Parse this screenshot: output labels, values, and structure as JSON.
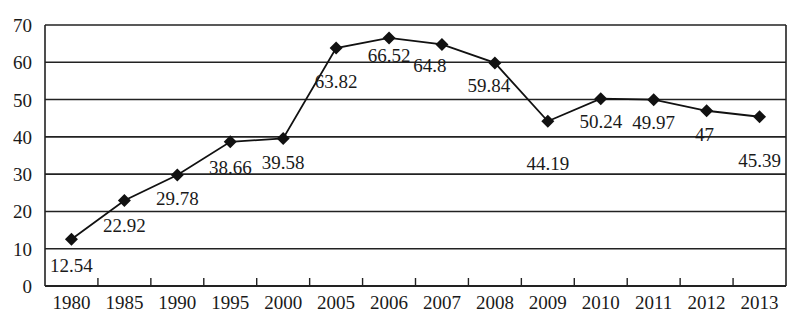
{
  "chart_data": {
    "type": "line",
    "title": "",
    "xlabel": "",
    "ylabel": "",
    "categories": [
      "1980",
      "1985",
      "1990",
      "1995",
      "2000",
      "2005",
      "2006",
      "2007",
      "2008",
      "2009",
      "2010",
      "2011",
      "2012",
      "2013"
    ],
    "series": [
      {
        "name": "",
        "values": [
          12.54,
          22.92,
          29.78,
          38.66,
          39.58,
          63.82,
          66.52,
          64.8,
          59.84,
          44.19,
          50.24,
          49.97,
          47,
          45.39
        ],
        "labels": [
          "12.54",
          "22.92",
          "29.78",
          "38.66",
          "39.58",
          "63.82",
          "66.52",
          "64.8",
          "59.84",
          "44.19",
          "50.24",
          "49.97",
          "47",
          "45.39"
        ],
        "marker": "diamond",
        "color": "#111111"
      }
    ],
    "ylim": [
      0,
      70
    ],
    "yticks": [
      0,
      10,
      20,
      30,
      40,
      50,
      60,
      70
    ],
    "ytick_labels": [
      "0",
      "10",
      "20",
      "30",
      "40",
      "50",
      "60",
      "70"
    ],
    "grid": true,
    "legend": null
  },
  "style": {
    "line_color": "#111111",
    "grid_color": "#222222",
    "text_color": "#1a1a1a",
    "background": "#ffffff"
  }
}
